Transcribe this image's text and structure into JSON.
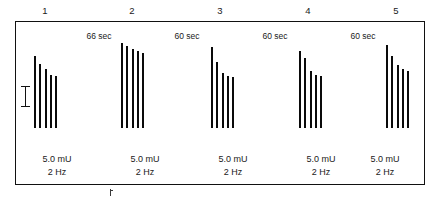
{
  "figure": {
    "title": "",
    "scale_bar": {
      "name": "calibration-bar",
      "label": ""
    },
    "bottom_tick": {
      "name": "baseline-tick",
      "label": ""
    }
  },
  "groups": [
    {
      "number": "1",
      "dose": "5.0 mU",
      "frequency": "2 Hz"
    },
    {
      "number": "2",
      "dose": "5.0 mU",
      "frequency": "2 Hz"
    },
    {
      "number": "3",
      "dose": "5.0 mU",
      "frequency": "2 Hz"
    },
    {
      "number": "4",
      "dose": "5.0 mU",
      "frequency": "2 Hz"
    },
    {
      "number": "5",
      "dose": "5.0 mU",
      "frequency": "2 Hz"
    }
  ],
  "intervals": [
    {
      "label": "66 sec"
    },
    {
      "label": "60 sec"
    },
    {
      "label": "60 sec"
    },
    {
      "label": "60 sec"
    }
  ],
  "chart_data": {
    "type": "bar",
    "title": "",
    "xlabel": "",
    "ylabel": "",
    "grid": false,
    "legend": null,
    "units": {
      "amplitude": "relative amplitude",
      "dose": "mU",
      "frequency": "Hz"
    },
    "categories": [
      "1",
      "2",
      "3",
      "4",
      "5"
    ],
    "stimulus_count_per_group": 5,
    "inter_group_intervals": [
      "66 sec",
      "60 sec",
      "60 sec",
      "60 sec"
    ],
    "annotations": {
      "group_labels": [
        "1",
        "2",
        "3",
        "4",
        "5"
      ],
      "dose_labels": [
        "5.0 mU",
        "5.0 mU",
        "5.0 mU",
        "5.0 mU",
        "5.0 mU"
      ],
      "frequency_labels": [
        "2 Hz",
        "2 Hz",
        "2 Hz",
        "2 Hz",
        "2 Hz"
      ],
      "calibration_bar_present": true
    },
    "series": [
      {
        "name": "Group 1",
        "values": [
          78,
          70,
          64,
          58,
          56
        ]
      },
      {
        "name": "Group 2",
        "values": [
          92,
          89,
          86,
          84,
          82
        ]
      },
      {
        "name": "Group 3",
        "values": [
          88,
          72,
          60,
          57,
          55
        ]
      },
      {
        "name": "Group 4",
        "values": [
          84,
          76,
          62,
          58,
          56
        ]
      },
      {
        "name": "Group 5",
        "values": [
          90,
          78,
          69,
          64,
          62
        ]
      }
    ],
    "ylim": [
      0,
      100
    ]
  }
}
